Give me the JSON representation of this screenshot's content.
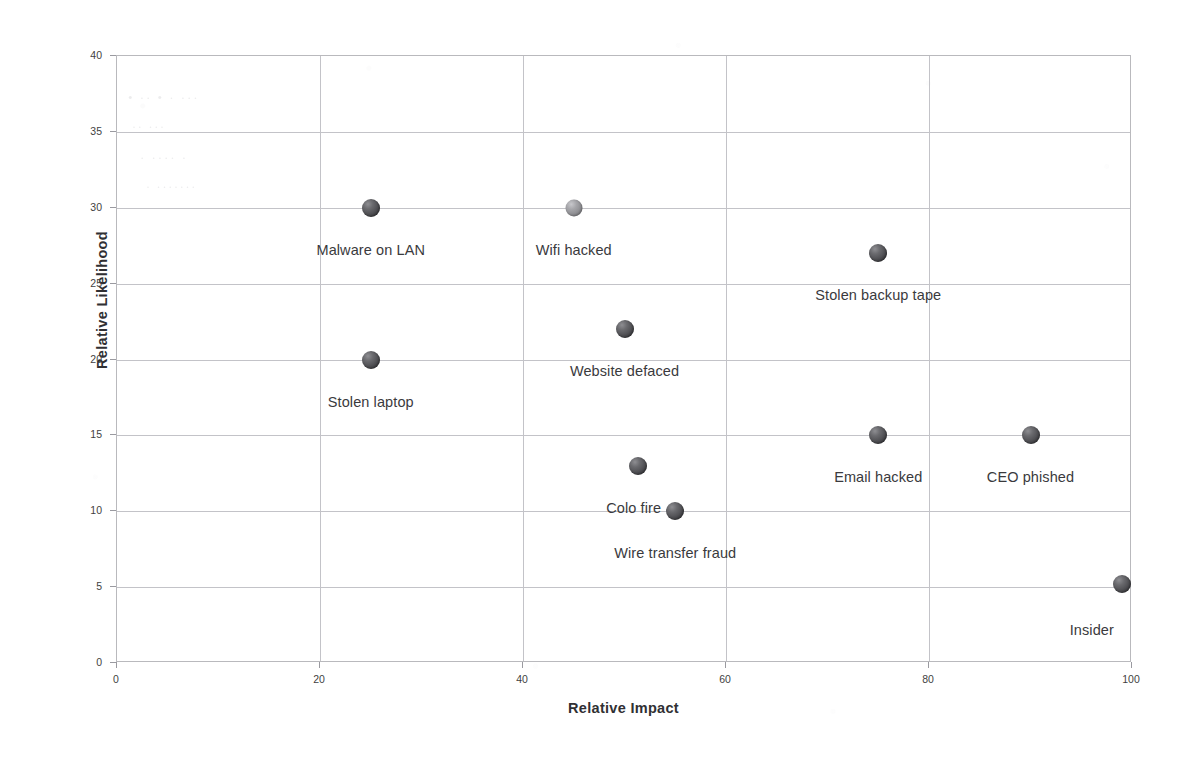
{
  "chart_data": {
    "type": "scatter",
    "title": "",
    "subtitle": "",
    "xlabel": "Relative Impact",
    "ylabel": "Relative Likelihood",
    "xlim": [
      0,
      100
    ],
    "ylim": [
      0,
      40
    ],
    "xticks": [
      0,
      20,
      40,
      60,
      80,
      100
    ],
    "yticks": [
      0,
      5,
      10,
      15,
      20,
      25,
      30,
      35,
      40
    ],
    "grid": "both",
    "legend": "none",
    "points": [
      {
        "label": "Malware on LAN",
        "x": 25,
        "y": 30,
        "marker": "dark",
        "label_dx": 0,
        "label_dy": 34
      },
      {
        "label": "Wifi hacked",
        "x": 45,
        "y": 30,
        "marker": "light",
        "label_dx": 0,
        "label_dy": 34
      },
      {
        "label": "Stolen backup tape",
        "x": 75,
        "y": 27,
        "marker": "dark",
        "label_dx": 0,
        "label_dy": 34
      },
      {
        "label": "Website defaced",
        "x": 50,
        "y": 22,
        "marker": "dark",
        "label_dx": 0,
        "label_dy": 34
      },
      {
        "label": "Stolen laptop",
        "x": 25,
        "y": 20,
        "marker": "dark",
        "label_dx": 0,
        "label_dy": 34
      },
      {
        "label": "Email hacked",
        "x": 75,
        "y": 15,
        "marker": "dark",
        "label_dx": 0,
        "label_dy": 34
      },
      {
        "label": "CEO phished",
        "x": 90,
        "y": 15,
        "marker": "dark",
        "label_dx": 0,
        "label_dy": 34
      },
      {
        "label": "Colo fire",
        "x": 51.3,
        "y": 13,
        "marker": "dark",
        "label_dx": -4,
        "label_dy": 34
      },
      {
        "label": "Wire transfer fraud",
        "x": 55,
        "y": 10,
        "marker": "dark",
        "label_dx": 0,
        "label_dy": 34
      },
      {
        "label": "Insider",
        "x": 99,
        "y": 5.2,
        "marker": "dark",
        "label_dx": -30,
        "label_dy": 38
      }
    ]
  },
  "axes": {
    "x_title": "Relative Impact",
    "y_title": "Relative Likelihood",
    "x_tick_labels": [
      "0",
      "20",
      "40",
      "60",
      "80",
      "100"
    ],
    "y_tick_labels": [
      "0",
      "5",
      "10",
      "15",
      "20",
      "25",
      "30",
      "35",
      "40"
    ]
  },
  "style": {
    "marker_dark_color": "#4c4c50",
    "marker_light_color": "#8c8c90",
    "gridline_color": "#c3c3c8",
    "axis_border_color": "#b9b9bd",
    "text_color": "#3a3a3d",
    "background": "#ffffff"
  },
  "bleed_through_artifacts": [
    {
      "text": "• ·· •  · ···",
      "left": 128,
      "top": 90,
      "size": 13
    },
    {
      "text": "··  ···",
      "left": 132,
      "top": 120,
      "size": 12
    },
    {
      "text": "· ···· ·",
      "left": 140,
      "top": 150,
      "size": 13
    },
    {
      "text": "· ·······",
      "left": 146,
      "top": 180,
      "size": 12
    }
  ]
}
